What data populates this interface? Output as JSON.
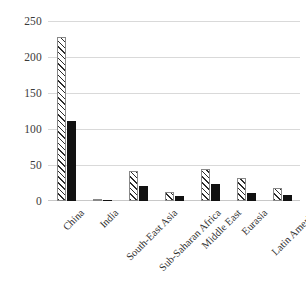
{
  "chart_data": {
    "type": "bar",
    "title": "",
    "subtitle": "",
    "xlabel": "",
    "ylabel": "",
    "ylim": [
      0,
      250
    ],
    "yticks": [
      0,
      50,
      100,
      150,
      200,
      250
    ],
    "grid": true,
    "legend": "none",
    "orientation": "vertical",
    "grouping": "grouped",
    "categories": [
      "China",
      "India",
      "South-East Asia",
      "Sub-Saharan Africa",
      "Middle East",
      "Eurasia",
      "Latin America"
    ],
    "series": [
      {
        "name": "series-1",
        "style": "hatched-diagonal-white",
        "color": "#ffffff",
        "hatch_color": "#2b2b2b",
        "values": [
          228,
          2,
          41,
          12,
          45,
          32,
          18
        ]
      },
      {
        "name": "series-2",
        "style": "solid-black",
        "color": "#111111",
        "values": [
          111,
          2,
          21,
          7,
          23,
          11,
          9
        ]
      }
    ],
    "colors": {
      "gridline": "#d9d9d9",
      "axis_text": "#3a3a3a",
      "background": "#ffffff"
    }
  }
}
